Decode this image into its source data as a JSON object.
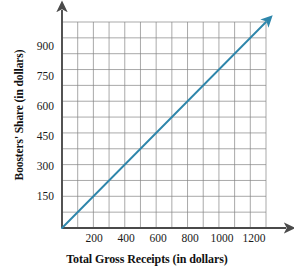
{
  "chart_data": {
    "type": "line",
    "title": "",
    "xlabel": "Total Gross Receipts (in dollars)",
    "ylabel": "Boosters' Share (in dollars)",
    "xlim": [
      0,
      1300
    ],
    "ylim": [
      0,
      975
    ],
    "xticks": [
      200,
      400,
      600,
      800,
      1000,
      1200
    ],
    "yticks": [
      150,
      300,
      450,
      600,
      750,
      900
    ],
    "x_minor_step": 100,
    "y_minor_step": 75,
    "grid": true,
    "legend": "none",
    "axis_arrows": true,
    "series": [
      {
        "name": "Boosters' Share",
        "color": "#2E86AB",
        "slope": 0.75,
        "intercept": 0,
        "arrow_end": true,
        "x": [
          0,
          200,
          400,
          600,
          800,
          1000,
          1200,
          1300
        ],
        "values": [
          0,
          150,
          300,
          450,
          600,
          750,
          900,
          975
        ]
      }
    ]
  },
  "axes": {
    "y_title": "Boosters' Share (in dollars)",
    "x_title": "Total Gross Receipts (in dollars)",
    "y_tick_labels": [
      "900",
      "750",
      "600",
      "450",
      "300",
      "150"
    ],
    "x_tick_labels": [
      "200",
      "400",
      "600",
      "800",
      "1000",
      "1200"
    ]
  },
  "colors": {
    "line": "#2E86AB",
    "grid": "#848484",
    "axis": "#4a4a4a",
    "text": "#111111",
    "background": "#ffffff"
  }
}
